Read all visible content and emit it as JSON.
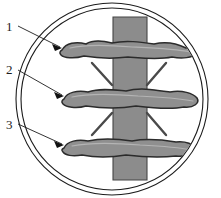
{
  "figure": {
    "caption": "",
    "background_color": "#ffffff",
    "outline_color": "#1c1c1c"
  },
  "frame": {
    "name": "double-ring-circle",
    "outer_circle": {
      "cx": 112,
      "cy": 99,
      "r": 96,
      "stroke": "#1c1c1c",
      "stroke_width": 1.1
    },
    "inner_circle": {
      "cx": 112,
      "cy": 99,
      "r": 91,
      "stroke": "#1c1c1c",
      "stroke_width": 1.1
    },
    "fill": "#ffffff"
  },
  "vertical_band": {
    "name": "vertical-column",
    "fill": "#8c8c8c",
    "stroke": "#3a3a3a",
    "x": 113,
    "top": 17,
    "bottom": 180,
    "width": 34
  },
  "horizontal_bands": [
    {
      "id": 1,
      "name": "upper-transverse-band",
      "cy": 49,
      "fill": "#8f8f8f",
      "stroke": "#2b2b2b",
      "halo": "#c9c9c9"
    },
    {
      "id": 2,
      "name": "middle-transverse-band",
      "cy": 97,
      "fill": "#8f8f8f",
      "stroke": "#2b2b2b",
      "halo": "#c9c9c9"
    },
    {
      "id": 3,
      "name": "lower-transverse-band",
      "cy": 146,
      "fill": "#8f8f8f",
      "stroke": "#2b2b2b",
      "halo": "#c9c9c9"
    }
  ],
  "diagonal_marks": {
    "name": "diagonal-tick-lines",
    "color": "#4a4a4a",
    "width": 2.2,
    "count": 4,
    "segments": [
      {
        "name": "upper-left-diagonal",
        "x1": 92,
        "y1": 64,
        "x2": 111,
        "y2": 85
      },
      {
        "name": "upper-right-diagonal",
        "x1": 165,
        "y1": 64,
        "x2": 147,
        "y2": 85
      },
      {
        "name": "lower-left-diagonal",
        "x1": 92,
        "y1": 134,
        "x2": 111,
        "y2": 113
      },
      {
        "name": "lower-right-diagonal",
        "x1": 165,
        "y1": 134,
        "x2": 147,
        "y2": 113
      }
    ]
  },
  "callouts": [
    {
      "name": "callout-1",
      "label": "1",
      "label_x": 6,
      "label_y": 31,
      "leader": {
        "x1": 17,
        "y1": 25,
        "x2": 61,
        "y2": 47
      },
      "arrow_angle": 26
    },
    {
      "name": "callout-2",
      "label": "2",
      "label_x": 6,
      "label_y": 74,
      "leader": {
        "x1": 17,
        "y1": 69,
        "x2": 63,
        "y2": 95
      },
      "arrow_angle": 29
    },
    {
      "name": "callout-3",
      "label": "3",
      "label_x": 6,
      "label_y": 129,
      "leader": {
        "x1": 17,
        "y1": 123,
        "x2": 63,
        "y2": 144
      },
      "arrow_angle": 25
    }
  ]
}
